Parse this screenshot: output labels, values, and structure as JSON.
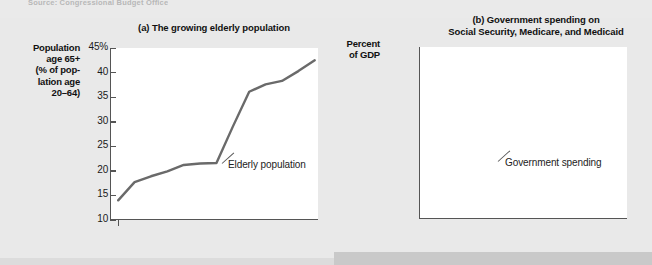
{
  "page": {
    "source_note": "Source: Congressional Budget Office"
  },
  "charts": {
    "a": {
      "title": "(a) The growing elderly population",
      "axis_caption": "Population age 65+ (% of population age 20–64)",
      "axis_caption_lines": [
        "Population",
        "age 65+",
        "(% of pop-",
        "lation age",
        "20–64)"
      ],
      "series_label": "Elderly population",
      "ytick_labels": [
        "45%",
        "40",
        "35",
        "30",
        "25",
        "20",
        "15",
        "10"
      ],
      "xtick_labels": [
        "1950",
        "1970",
        "1990",
        "2010",
        "2030",
        "2050",
        "2070"
      ]
    },
    "b": {
      "title_lines": [
        "(b) Government spending on",
        "Social Security, Medicare, and Medicaid"
      ],
      "title": "(b) Government spending on Social Security, Medicare, and Medicaid",
      "axis_caption": "Percent of GDP",
      "axis_caption_lines": [
        "Percent",
        "of GDP"
      ],
      "series_label": "Government spending",
      "ytick_labels": [
        "20%",
        "15",
        "10",
        "5",
        "0"
      ],
      "xtick_labels": [
        "1950",
        "1970",
        "1990",
        "2010",
        "2030",
        "2050",
        "2070"
      ]
    }
  },
  "chart_data": [
    {
      "type": "line",
      "panel": "a",
      "title": "(a) The growing elderly population",
      "xlabel": "",
      "ylabel": "Population age 65+ (% of population age 20–64)",
      "xlim": [
        1945,
        2072
      ],
      "ylim": [
        10,
        45
      ],
      "yticks": [
        10,
        15,
        20,
        25,
        30,
        35,
        40,
        45
      ],
      "ytick_labels": [
        "10",
        "15",
        "20",
        "25",
        "30",
        "35",
        "40",
        "45%"
      ],
      "xticks": [
        1950,
        1970,
        1990,
        2010,
        2030,
        2050,
        2070
      ],
      "grid": false,
      "legend": "inline-annotation",
      "annotations": [
        {
          "text": "Elderly population",
          "x": 2012,
          "y": 23.5
        }
      ],
      "series": [
        {
          "name": "Elderly population",
          "color": "#6a6a6a",
          "x": [
            1950,
            1960,
            1970,
            1980,
            1990,
            2000,
            2010,
            2020,
            2030,
            2040,
            2050,
            2060,
            2070
          ],
          "values": [
            14.0,
            17.7,
            18.9,
            19.9,
            21.2,
            21.5,
            21.6,
            29.0,
            36.1,
            37.6,
            38.3,
            40.3,
            42.5
          ]
        }
      ]
    },
    {
      "type": "line",
      "panel": "b",
      "title": "(b) Government spending on Social Security, Medicare, and Medicaid",
      "xlabel": "",
      "ylabel": "Percent of GDP",
      "xlim": [
        1945,
        2072
      ],
      "ylim": [
        0,
        20
      ],
      "yticks": [
        0,
        5,
        10,
        15,
        20
      ],
      "ytick_labels": [
        "0",
        "5",
        "10",
        "15",
        "20%"
      ],
      "xticks": [
        1950,
        1970,
        1990,
        2010,
        2030,
        2050,
        2070
      ],
      "grid": false,
      "legend": "inline-annotation",
      "annotations": [
        {
          "text": "Government spending",
          "x": 2014,
          "y": 6.2
        }
      ],
      "series": [
        {
          "name": "Government spending",
          "color": "#111111",
          "x": [
            1950,
            1960,
            1970,
            1980,
            1985,
            1990,
            2000,
            2010,
            2020,
            2030,
            2040,
            2050,
            2060,
            2070
          ],
          "values": [
            0.3,
            2.1,
            4.1,
            6.4,
            7.0,
            7.6,
            8.3,
            9.6,
            12.5,
            14.8,
            16.1,
            17.1,
            18.4,
            20.1
          ]
        }
      ]
    }
  ]
}
